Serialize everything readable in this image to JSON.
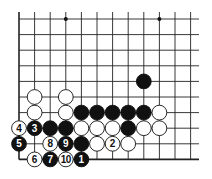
{
  "diagram": {
    "type": "go-board-fragment",
    "columns": 12,
    "rows": 10,
    "edges": [
      "left",
      "bottom"
    ],
    "hoshi": [
      [
        3,
        0
      ],
      [
        9,
        0
      ]
    ],
    "colors": {
      "black": "#111111",
      "white": "#ffffff",
      "line": "#222222"
    },
    "stones": [
      {
        "color": "black",
        "col": 8,
        "row": 4,
        "label": ""
      },
      {
        "color": "white",
        "col": 1,
        "row": 5,
        "label": ""
      },
      {
        "color": "white",
        "col": 3,
        "row": 5,
        "label": ""
      },
      {
        "color": "white",
        "col": 1,
        "row": 6,
        "label": ""
      },
      {
        "color": "white",
        "col": 3,
        "row": 6,
        "label": ""
      },
      {
        "color": "black",
        "col": 4,
        "row": 6,
        "label": ""
      },
      {
        "color": "black",
        "col": 5,
        "row": 6,
        "label": ""
      },
      {
        "color": "black",
        "col": 6,
        "row": 6,
        "label": ""
      },
      {
        "color": "black",
        "col": 7,
        "row": 6,
        "label": ""
      },
      {
        "color": "black",
        "col": 8,
        "row": 6,
        "label": ""
      },
      {
        "color": "white",
        "col": 9,
        "row": 6,
        "label": ""
      },
      {
        "color": "white",
        "col": 0,
        "row": 7,
        "label": "4"
      },
      {
        "color": "black",
        "col": 1,
        "row": 7,
        "label": "3"
      },
      {
        "color": "black",
        "col": 2,
        "row": 7,
        "label": ""
      },
      {
        "color": "black",
        "col": 3,
        "row": 7,
        "label": ""
      },
      {
        "color": "white",
        "col": 4,
        "row": 7,
        "label": ""
      },
      {
        "color": "white",
        "col": 5,
        "row": 7,
        "label": ""
      },
      {
        "color": "white",
        "col": 6,
        "row": 7,
        "label": ""
      },
      {
        "color": "black",
        "col": 7,
        "row": 7,
        "label": ""
      },
      {
        "color": "white",
        "col": 8,
        "row": 7,
        "label": ""
      },
      {
        "color": "white",
        "col": 9,
        "row": 7,
        "label": ""
      },
      {
        "color": "black",
        "col": 0,
        "row": 8,
        "label": "5"
      },
      {
        "color": "white",
        "col": 2,
        "row": 8,
        "label": "8"
      },
      {
        "color": "black",
        "col": 3,
        "row": 8,
        "label": "9"
      },
      {
        "color": "black",
        "col": 4,
        "row": 8,
        "label": ""
      },
      {
        "color": "white",
        "col": 5,
        "row": 8,
        "label": ""
      },
      {
        "color": "white",
        "col": 6,
        "row": 8,
        "label": "2"
      },
      {
        "color": "white",
        "col": 7,
        "row": 8,
        "label": ""
      },
      {
        "color": "white",
        "col": 1,
        "row": 9,
        "label": "6"
      },
      {
        "color": "black",
        "col": 2,
        "row": 9,
        "label": "7"
      },
      {
        "color": "white",
        "col": 3,
        "row": 9,
        "label": "10"
      },
      {
        "color": "black",
        "col": 4,
        "row": 9,
        "label": "1"
      }
    ]
  }
}
